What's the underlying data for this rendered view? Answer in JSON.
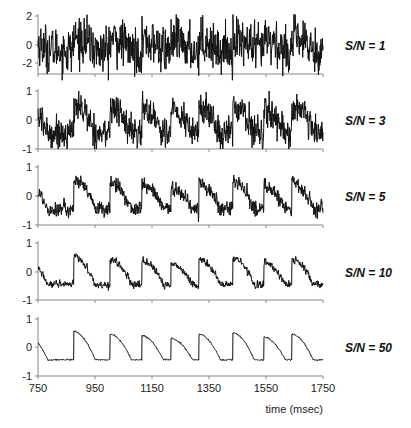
{
  "chart_data": {
    "type": "line",
    "title": "",
    "xlabel": "time (msec)",
    "ylabel": "",
    "xlim": [
      750,
      1750
    ],
    "x_ticks": [
      750,
      950,
      1150,
      1350,
      1550,
      1750
    ],
    "grid": false,
    "legend": "none",
    "underlying_signal": {
      "description": "Periodic sawtooth-like waveform: abrupt rise at each event then decaying curve to a plateau at about -0.45",
      "start_value": 0.38,
      "trough_value": -0.45,
      "events_ms": [
        876,
        1003,
        1115,
        1217,
        1315,
        1434,
        1543,
        1641
      ],
      "peak_values": [
        0.55,
        0.45,
        0.4,
        0.3,
        0.45,
        0.5,
        0.35,
        0.45
      ],
      "decay_duration_ms": 75
    },
    "panels": [
      {
        "label": "S/N = 1",
        "snr": 1,
        "ylim": [
          -3,
          2.6
        ],
        "y_ticks": [
          2,
          0,
          -2
        ],
        "noise_sd": 0.9
      },
      {
        "label": "S/N = 3",
        "snr": 3,
        "ylim": [
          -1,
          1
        ],
        "y_ticks": [
          1,
          0,
          -1
        ],
        "noise_sd": 0.25
      },
      {
        "label": "S/N = 5",
        "snr": 5,
        "ylim": [
          -1,
          1
        ],
        "y_ticks": [
          1,
          0,
          -1
        ],
        "noise_sd": 0.12
      },
      {
        "label": "S/N = 10",
        "snr": 10,
        "ylim": [
          -1,
          1
        ],
        "y_ticks": [
          1,
          0,
          -1
        ],
        "noise_sd": 0.06
      },
      {
        "label": "S/N = 50",
        "snr": 50,
        "ylim": [
          -1,
          1
        ],
        "y_ticks": [
          1,
          0,
          -1
        ],
        "noise_sd": 0.012
      }
    ]
  },
  "layout": {
    "x_axis_px": [
      38,
      323
    ],
    "panels_px": [
      {
        "top": 16,
        "zero": 45,
        "bottom": 74,
        "tick_px": [
          16,
          45,
          63
        ]
      },
      {
        "top": 91,
        "zero": 120,
        "bottom": 149,
        "tick_px": [
          91,
          120,
          149
        ]
      },
      {
        "top": 167,
        "zero": 196,
        "bottom": 225,
        "tick_px": [
          167,
          196,
          225
        ]
      },
      {
        "top": 243,
        "zero": 272,
        "bottom": 300,
        "tick_px": [
          243,
          272,
          300
        ]
      },
      {
        "top": 319,
        "zero": 347,
        "bottom": 376,
        "tick_px": [
          319,
          347,
          376
        ]
      }
    ],
    "label_x": 345
  }
}
